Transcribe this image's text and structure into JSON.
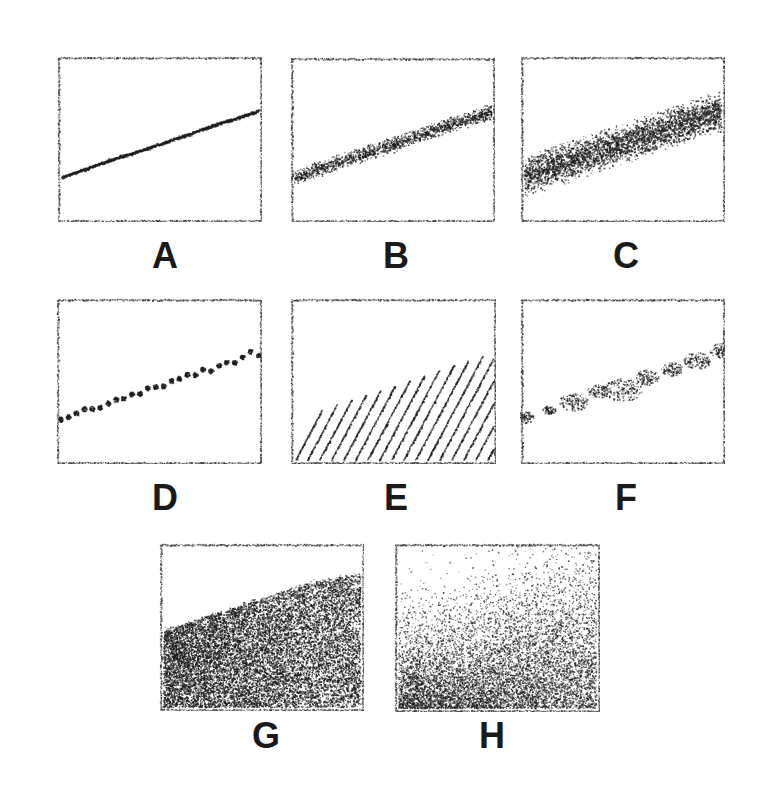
{
  "figure": {
    "width": 765,
    "height": 792,
    "background_color": "#ffffff",
    "ink_color": "#1c1c1c",
    "frame_color": "#3a3a3a",
    "label_font_size": 36,
    "label_color": "#1a1a1a",
    "panel_count": 8,
    "rows": [
      {
        "name": "row-1",
        "panels": [
          "A",
          "B",
          "C"
        ]
      },
      {
        "name": "row-2",
        "panels": [
          "D",
          "E",
          "F"
        ]
      },
      {
        "name": "row-3",
        "panels": [
          "G",
          "H"
        ]
      }
    ]
  },
  "chart_data": {
    "type": "scatter",
    "xlabel": "",
    "ylabel": "",
    "xlim": [
      0,
      1
    ],
    "ylim": [
      0,
      1
    ],
    "grid": false,
    "legend": "none",
    "shared_trend": {
      "description": "All eight panels depict the same rising left-to-right linear trend rendered with different amounts of scatter, dispersion and shading.",
      "y_at_x0": 0.26,
      "y_at_x1": 0.68,
      "slope": 0.42
    },
    "panels": [
      {
        "label": "A",
        "name": "panel-a",
        "render": "line",
        "description": "Thin solid line, essentially zero scatter",
        "x": [
          0.0,
          0.125,
          0.25,
          0.375,
          0.5,
          0.625,
          0.75,
          0.875,
          1.0
        ],
        "y": [
          0.26,
          0.315,
          0.37,
          0.42,
          0.47,
          0.525,
          0.58,
          0.63,
          0.68
        ],
        "band_half_width": 0.008,
        "point_count": 900,
        "point_size": 1.0,
        "density": 1.0,
        "frame": {
          "x": 57,
          "y": 56,
          "w": 205,
          "h": 166
        },
        "label_pos": {
          "x": 165,
          "y": 238
        }
      },
      {
        "label": "B",
        "name": "panel-b",
        "render": "band",
        "description": "Moderate scatter band about the trend line",
        "x": [
          0.0,
          0.125,
          0.25,
          0.375,
          0.5,
          0.625,
          0.75,
          0.875,
          1.0
        ],
        "y": [
          0.26,
          0.315,
          0.37,
          0.42,
          0.47,
          0.525,
          0.58,
          0.63,
          0.68
        ],
        "band_half_width": 0.042,
        "point_count": 1700,
        "point_size": 1.15,
        "density": 1.0,
        "frame": {
          "x": 290,
          "y": 57,
          "w": 205,
          "h": 165
        },
        "label_pos": {
          "x": 396,
          "y": 238
        }
      },
      {
        "label": "C",
        "name": "panel-c",
        "render": "band",
        "description": "Wide dense scatter band about the trend line",
        "x": [
          0.0,
          0.125,
          0.25,
          0.375,
          0.5,
          0.625,
          0.75,
          0.875,
          1.0
        ],
        "y": [
          0.26,
          0.315,
          0.37,
          0.42,
          0.47,
          0.525,
          0.58,
          0.63,
          0.68
        ],
        "band_half_width": 0.105,
        "point_count": 3400,
        "point_size": 1.25,
        "density": 1.0,
        "frame": {
          "x": 520,
          "y": 56,
          "w": 205,
          "h": 166
        },
        "label_pos": {
          "x": 626,
          "y": 238
        }
      },
      {
        "label": "D",
        "name": "panel-d",
        "render": "dots",
        "description": "Sparse discrete dots spaced along the trend line",
        "x": [
          0.0,
          0.125,
          0.25,
          0.375,
          0.5,
          0.625,
          0.75,
          0.875,
          1.0
        ],
        "y": [
          0.26,
          0.315,
          0.37,
          0.42,
          0.47,
          0.525,
          0.58,
          0.63,
          0.68
        ],
        "marker_count": 26,
        "marker_radius": 2.6,
        "band_half_width": 0.02,
        "frame": {
          "x": 56,
          "y": 298,
          "w": 206,
          "h": 166
        },
        "label_pos": {
          "x": 165,
          "y": 480
        }
      },
      {
        "label": "E",
        "name": "panel-e",
        "render": "hatch",
        "description": "Diagonal hatch lines filling the area beneath the rising boundary",
        "x": [
          0.0,
          0.125,
          0.25,
          0.375,
          0.5,
          0.625,
          0.75,
          0.875,
          1.0
        ],
        "y": [
          0.26,
          0.315,
          0.37,
          0.42,
          0.47,
          0.525,
          0.58,
          0.63,
          0.68
        ],
        "hatch_spacing": 12,
        "hatch_angle_deg": 62,
        "hatch_line_width": 1.5,
        "frame": {
          "x": 290,
          "y": 298,
          "w": 206,
          "h": 166
        },
        "label_pos": {
          "x": 396,
          "y": 480
        }
      },
      {
        "label": "F",
        "name": "panel-f",
        "render": "clumps",
        "description": "Discrete clumps of points spaced along the trend line",
        "x": [
          0.0,
          0.125,
          0.25,
          0.375,
          0.5,
          0.625,
          0.75,
          0.875,
          1.0
        ],
        "y": [
          0.26,
          0.315,
          0.37,
          0.42,
          0.47,
          0.525,
          0.58,
          0.63,
          0.68
        ],
        "clump_count": 9,
        "clump_radius": [
          7,
          5,
          11,
          8,
          14,
          9,
          8,
          10,
          9
        ],
        "points_per_clump": 110,
        "point_size": 1.2,
        "frame": {
          "x": 520,
          "y": 298,
          "w": 205,
          "h": 166
        },
        "label_pos": {
          "x": 626,
          "y": 480
        }
      },
      {
        "label": "G",
        "name": "panel-g",
        "render": "fill-uniform",
        "description": "Uniform dense stipple fill below a sharp rising boundary",
        "x": [
          0.0,
          0.125,
          0.25,
          0.375,
          0.5,
          0.625,
          0.75,
          0.875,
          1.0
        ],
        "y": [
          0.26,
          0.315,
          0.37,
          0.42,
          0.47,
          0.525,
          0.58,
          0.63,
          0.68
        ],
        "y_boundary": [
          0.48,
          0.53,
          0.58,
          0.63,
          0.68,
          0.73,
          0.78,
          0.81,
          0.84
        ],
        "point_count": 13000,
        "point_size": 1.15,
        "edge_softness": 0.02,
        "frame": {
          "x": 159,
          "y": 543,
          "w": 205,
          "h": 168
        },
        "label_pos": {
          "x": 266,
          "y": 718
        }
      },
      {
        "label": "H",
        "name": "panel-h",
        "render": "fill-gradient",
        "description": "Graded stipple fill, dense at the base and fading upward with a diffuse boundary",
        "x": [
          0.0,
          0.125,
          0.25,
          0.375,
          0.5,
          0.625,
          0.75,
          0.875,
          1.0
        ],
        "y": [
          0.26,
          0.315,
          0.37,
          0.42,
          0.47,
          0.525,
          0.58,
          0.63,
          0.68
        ],
        "y_boundary": [
          0.46,
          0.5,
          0.55,
          0.6,
          0.66,
          0.71,
          0.77,
          0.81,
          0.85
        ],
        "point_count": 14000,
        "point_size": 1.1,
        "edge_softness": 0.22,
        "frame": {
          "x": 394,
          "y": 543,
          "w": 206,
          "h": 169
        },
        "label_pos": {
          "x": 492,
          "y": 718
        }
      }
    ]
  }
}
